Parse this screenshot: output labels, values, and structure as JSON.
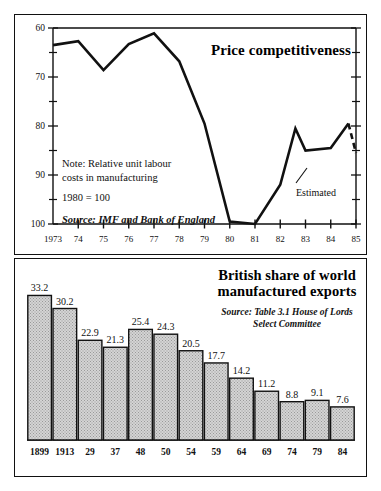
{
  "page": {
    "background": "#ffffff",
    "ink": "#111111"
  },
  "line_chart": {
    "title": "Price competitiveness",
    "note_line1": "Note: Relative unit labour",
    "note_line2": "costs in manufacturing",
    "note_base": "1980 = 100",
    "source": "Source: IMF and Bank of England",
    "estimated_label": "Estimated"
  },
  "bar_chart": {
    "title_line1": "British share of world",
    "title_line2": "manufactured exports",
    "source_line1": "Source: Table 3.1 House of Lords",
    "source_line2": "Select Committee"
  },
  "chart_data": [
    {
      "id": "price-competitiveness",
      "type": "line",
      "title": "Price competitiveness",
      "xlabel": "",
      "ylabel": "",
      "note": "Note: Relative unit labour costs in manufacturing. 1980 = 100",
      "source": "Source: IMF and Bank of England",
      "axis_inverted_y": true,
      "ylim": [
        60,
        100
      ],
      "yticks": [
        60,
        70,
        80,
        90,
        100
      ],
      "yticks_minor": [
        65,
        75,
        85,
        95
      ],
      "grid": false,
      "legend": "none",
      "xtick_labels": [
        "1973",
        "74",
        "75",
        "76",
        "77",
        "78",
        "79",
        "80",
        "81",
        "82",
        "83",
        "84",
        "85"
      ],
      "x": [
        1973,
        1974,
        1975,
        1976,
        1977,
        1978,
        1979,
        1980,
        1981,
        1982,
        1982.6,
        1983,
        1984,
        1984.7,
        1985
      ],
      "values": [
        63.5,
        62.7,
        68.6,
        63.3,
        61.1,
        66.8,
        79.5,
        99.5,
        100.0,
        92.0,
        80.5,
        85.0,
        84.5,
        79.5,
        85.5
      ],
      "annotations": [
        {
          "text": "Estimated",
          "x": 1984.6,
          "y": 85.5,
          "style": "leader-line"
        }
      ],
      "segments": [
        {
          "style": "solid",
          "from_index": 0,
          "to_index": 13
        },
        {
          "style": "dashed",
          "from_index": 13,
          "to_index": 14,
          "label": "Estimated"
        }
      ]
    },
    {
      "id": "british-share-world-manufactured-exports",
      "type": "bar",
      "title": "British share of world manufactured exports",
      "source": "Source: Table 3.1 House of Lords Select Committee",
      "xlabel": "",
      "ylabel": "",
      "ylim": [
        0,
        35
      ],
      "grid": false,
      "legend": "none",
      "categories": [
        "1899",
        "1913",
        "29",
        "37",
        "48",
        "50",
        "54",
        "59",
        "64",
        "69",
        "74",
        "79",
        "84"
      ],
      "values": [
        33.2,
        30.2,
        22.9,
        21.3,
        25.4,
        24.3,
        20.5,
        17.7,
        14.2,
        11.2,
        8.8,
        9.1,
        7.6
      ],
      "value_labels": [
        "33.2",
        "30.2",
        "22.9",
        "21.3",
        "25.4",
        "24.3",
        "20.5",
        "17.7",
        "14.2",
        "11.2",
        "8.8",
        "9.1",
        "7.6"
      ],
      "bar_fill": "#d4d4d4",
      "bar_edge": "#111111"
    }
  ]
}
